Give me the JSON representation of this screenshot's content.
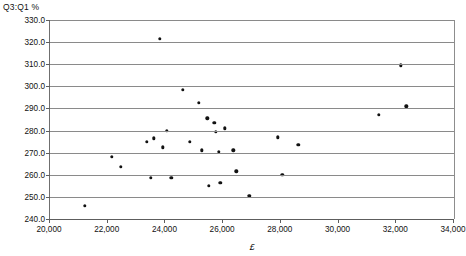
{
  "chart_data": {
    "type": "scatter",
    "title": "",
    "ylabel": "Q3:Q1 %",
    "xlabel": "£",
    "xlim": [
      20000,
      34000
    ],
    "ylim": [
      240.0,
      330.0
    ],
    "xticks": [
      20000,
      22000,
      24000,
      26000,
      28000,
      30000,
      32000,
      34000
    ],
    "xticklabels": [
      "20,000",
      "22,000",
      "24,000",
      "26,000",
      "28,000",
      "30,000",
      "32,000",
      "34,000"
    ],
    "yticks": [
      240.0,
      250.0,
      260.0,
      270.0,
      280.0,
      290.0,
      300.0,
      310.0,
      320.0,
      330.0
    ],
    "yticklabels": [
      "240.0",
      "250.0",
      "260.0",
      "270.0",
      "280.0",
      "290.0",
      "300.0",
      "310.0",
      "320.0",
      "330.0"
    ],
    "grid": "horizontal",
    "legend": "none",
    "marker_color": "#121212",
    "points": [
      {
        "x": 21200,
        "y": 246.0
      },
      {
        "x": 22150,
        "y": 268.0
      },
      {
        "x": 22450,
        "y": 263.5
      },
      {
        "x": 23350,
        "y": 275.0
      },
      {
        "x": 23500,
        "y": 258.5
      },
      {
        "x": 23600,
        "y": 276.5
      },
      {
        "x": 23800,
        "y": 321.5
      },
      {
        "x": 23900,
        "y": 272.5
      },
      {
        "x": 24050,
        "y": 280.0
      },
      {
        "x": 24200,
        "y": 258.5
      },
      {
        "x": 24600,
        "y": 298.5
      },
      {
        "x": 24850,
        "y": 275.0
      },
      {
        "x": 25150,
        "y": 292.5
      },
      {
        "x": 25250,
        "y": 271.0
      },
      {
        "x": 25450,
        "y": 285.5
      },
      {
        "x": 25500,
        "y": 255.0
      },
      {
        "x": 25700,
        "y": 283.5
      },
      {
        "x": 25750,
        "y": 279.5
      },
      {
        "x": 25850,
        "y": 270.5
      },
      {
        "x": 25900,
        "y": 256.5
      },
      {
        "x": 26050,
        "y": 281.0
      },
      {
        "x": 26350,
        "y": 271.0
      },
      {
        "x": 26450,
        "y": 261.5
      },
      {
        "x": 26900,
        "y": 250.5
      },
      {
        "x": 27900,
        "y": 277.0
      },
      {
        "x": 28050,
        "y": 260.0
      },
      {
        "x": 28600,
        "y": 273.5
      },
      {
        "x": 31400,
        "y": 287.0
      },
      {
        "x": 32150,
        "y": 309.5
      },
      {
        "x": 32350,
        "y": 291.0
      }
    ]
  }
}
